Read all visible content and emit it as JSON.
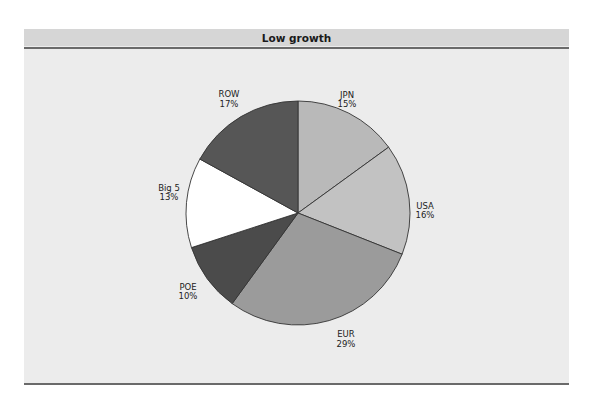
{
  "header": {
    "title": "Low growth"
  },
  "colors": {
    "panel_bg": "#ececec",
    "header_bg": "#d6d6d6",
    "rule": "#6a6a6a",
    "slice_outline": "#333333"
  },
  "chart_data": {
    "type": "pie",
    "title": "Low growth",
    "start_angle_deg": 0,
    "direction": "clockwise",
    "categories": [
      "JPN",
      "USA",
      "EUR",
      "POE",
      "Big 5",
      "ROW"
    ],
    "values": [
      15,
      16,
      29,
      10,
      13,
      17
    ],
    "value_labels": [
      "15%",
      "16%",
      "29%",
      "10%",
      "13%",
      "17%"
    ],
    "slice_colors": [
      "#b9b9b9",
      "#c2c2c2",
      "#9b9b9b",
      "#4b4b4b",
      "#ffffff",
      "#565656"
    ],
    "legend": "none (labels placed outside slices)"
  }
}
